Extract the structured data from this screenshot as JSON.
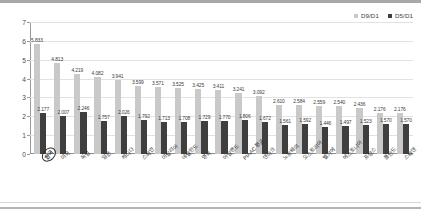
{
  "chart_data": {
    "type": "bar",
    "title": "",
    "xlabel": "",
    "ylabel": "",
    "ylim": [
      0,
      7
    ],
    "yticks": [
      0,
      1,
      2,
      3,
      4,
      5,
      6,
      7
    ],
    "grid": true,
    "legend_position": "top-right",
    "categories": [
      "한국",
      "미국",
      "독일",
      "일본",
      "캐나다",
      "스페인",
      "이탈리아",
      "네덜란드",
      "영국",
      "아일랜드",
      "PIAAC 평균",
      "덴마크",
      "노르웨이",
      "오스트리아",
      "벨기에",
      "에스토니아",
      "프랑스",
      "폴란드",
      "스웨덴"
    ],
    "series": [
      {
        "name": "D9/D1",
        "color": "#c9c9c9",
        "values": [
          5.833,
          4.813,
          4.219,
          4.082,
          3.941,
          3.599,
          3.571,
          3.525,
          3.425,
          3.411,
          3.241,
          3.092,
          2.61,
          2.584,
          2.559,
          2.54,
          2.436,
          2.176,
          2.176
        ]
      },
      {
        "name": "D5/D1",
        "color": "#3f3f3f",
        "values": [
          2.177,
          2.007,
          2.246,
          1.757,
          2.026,
          1.792,
          1.713,
          1.708,
          1.729,
          1.77,
          1.806,
          1.672,
          1.561,
          1.592,
          1.446,
          1.497,
          1.523,
          1.57,
          1.57
        ]
      }
    ]
  },
  "legend": {
    "items": [
      {
        "label": "D9/D1",
        "color": "#c9c9c9"
      },
      {
        "label": "D5/D1",
        "color": "#3f3f3f"
      }
    ]
  },
  "highlight": {
    "category_index": 0
  }
}
